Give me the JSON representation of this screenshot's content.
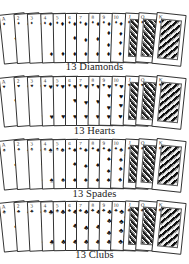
{
  "rows": [
    {
      "suit": "diamonds",
      "symbol": "♦",
      "label": "13 Diamonds",
      "top": 13,
      "label_top": 61
    },
    {
      "suit": "hearts",
      "symbol": "♥",
      "label": "13 Hearts",
      "top": 76,
      "label_top": 125
    },
    {
      "suit": "spades",
      "symbol": "♠",
      "label": "13 Spades",
      "top": 139,
      "label_top": 188
    },
    {
      "suit": "clubs",
      "symbol": "♣",
      "label": "13 Clubs",
      "top": 201,
      "label_top": 249
    }
  ],
  "ranks": [
    "A",
    "2",
    "3",
    "4",
    "5",
    "6",
    "7",
    "8",
    "9",
    "10",
    "J",
    "Q",
    "K"
  ],
  "labels": {
    "diamonds": "13 Diamonds",
    "hearts": "13 Hearts",
    "spades": "13 Spades",
    "clubs": "13 Clubs"
  }
}
